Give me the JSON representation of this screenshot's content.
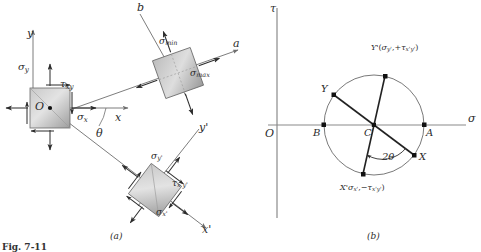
{
  "figure": {
    "title_left": "(a)",
    "title_right": "(b)",
    "caption_partial": "Fig. 7-11"
  },
  "panel_a": {
    "name": "stress-element-transformation-diagram",
    "axes": [
      {
        "id": "y-axis",
        "label": "y"
      },
      {
        "id": "x-axis",
        "label": "x"
      },
      {
        "id": "a-axis",
        "label": "a"
      },
      {
        "id": "b-axis",
        "label": "b"
      },
      {
        "id": "x-prime-axis",
        "label": "x'"
      },
      {
        "id": "y-prime-axis",
        "label": "y'"
      }
    ],
    "origin_label": "O",
    "angle_label": "θ",
    "original_element": {
      "sigma_x": "σ",
      "sigma_x_sub": "x",
      "sigma_y": "σ",
      "sigma_y_sub": "y",
      "tau_xy": "τ",
      "tau_xy_sub": "xy"
    },
    "principal_element": {
      "sigma_max": "σ",
      "sigma_max_sub": "max",
      "sigma_min": "σ",
      "sigma_min_sub": "min"
    },
    "rotated_element": {
      "sigma_xp": "σ",
      "sigma_xp_sub": "x'",
      "sigma_yp": "σ",
      "sigma_yp_sub": "y'",
      "tau_xpyp": "τ",
      "tau_xpyp_sub": "x'y'"
    }
  },
  "panel_b": {
    "name": "mohrs-circle-diagram",
    "axes": [
      {
        "id": "sigma-axis",
        "label": "σ"
      },
      {
        "id": "tau-axis",
        "label": "τ"
      }
    ],
    "origin_label": "O",
    "points": [
      {
        "id": "point-A",
        "label": "A"
      },
      {
        "id": "point-B",
        "label": "B"
      },
      {
        "id": "point-C",
        "label": "C"
      },
      {
        "id": "point-X",
        "label": "X"
      },
      {
        "id": "point-Y",
        "label": "Y"
      },
      {
        "id": "point-X-prime",
        "label": "X'",
        "coords": "(σx' , −τx'y')"
      },
      {
        "id": "point-Y-prime",
        "label": "Y'",
        "coords": "(σy' , +τx'y')"
      }
    ],
    "x_prime_label_main": "X'",
    "x_prime_label_paren_open": "(",
    "x_prime_sigma": "σ",
    "x_prime_sigma_sub": "x'",
    "x_prime_comma": ",",
    "x_prime_minus": "−",
    "x_prime_tau": "τ",
    "x_prime_tau_sub": "x'y'",
    "x_prime_paren_close": ")",
    "y_prime_label_main": "Y'",
    "y_prime_paren_open": "(",
    "y_prime_sigma": "σ",
    "y_prime_sigma_sub": "y'",
    "y_prime_comma": ",",
    "y_prime_plus": "+",
    "y_prime_tau": "τ",
    "y_prime_tau_sub": "x'y'",
    "y_prime_paren_close": ")",
    "double_angle_label": "2θ",
    "geometry": {
      "center_x": 374,
      "center_y": 125,
      "radius": 50
    }
  },
  "colors": {
    "line": "#2b2b2b",
    "axis": "#7a7a7a",
    "element_fill_light": "#d9d9d9",
    "element_fill_dark": "#a8a8a8",
    "circle_stroke": "#555555"
  }
}
